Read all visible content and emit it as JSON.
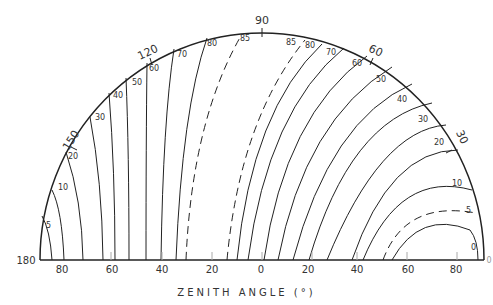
{
  "diagram": {
    "type": "semicircular contour diagram",
    "xlabel": "ZENITH ANGLE (°)",
    "x_ticks": [
      "80",
      "60",
      "40",
      "20",
      "0",
      "20",
      "40",
      "60",
      "80"
    ],
    "left_end_label": "180",
    "right_end_label": "0",
    "rim_labels": [
      "150",
      "120",
      "90",
      "60",
      "30"
    ],
    "left_contour_labels": [
      "5",
      "10",
      "20",
      "30",
      "40",
      "50",
      "60",
      "70",
      "80",
      "85"
    ],
    "right_contour_labels": [
      "85",
      "80",
      "70",
      "60",
      "50",
      "40",
      "30",
      "20",
      "10",
      "5",
      "0"
    ],
    "dashed_contours": [
      "85 (left)",
      "85 (right)",
      "5 (right)"
    ]
  }
}
